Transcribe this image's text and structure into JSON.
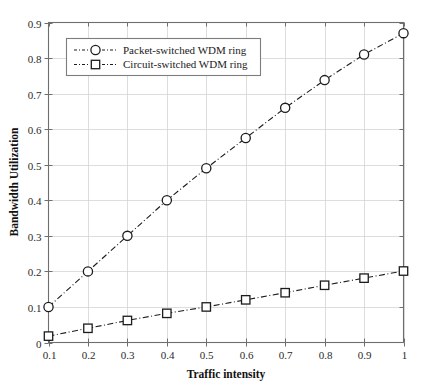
{
  "chart_data": {
    "type": "line",
    "title": "",
    "xlabel": "Traffic intensity",
    "ylabel": "Bandwidth Utilization",
    "x": [
      0.1,
      0.2,
      0.3,
      0.4,
      0.5,
      0.6,
      0.7,
      0.8,
      0.9,
      1.0
    ],
    "xtick_labels": [
      "0.1",
      "0.2",
      "0.3",
      "0.4",
      "0.5",
      "0.6",
      "0.7",
      "0.8",
      "0.9",
      "1"
    ],
    "ytick_labels": [
      "0",
      "0.1",
      "0.2",
      "0.3",
      "0.4",
      "0.5",
      "0.6",
      "0.7",
      "0.8",
      "0.9"
    ],
    "yticks": [
      0,
      0.1,
      0.2,
      0.3,
      0.4,
      0.5,
      0.6,
      0.7,
      0.8,
      0.9
    ],
    "xlim": [
      0.1,
      1.0
    ],
    "ylim": [
      0.0,
      0.9
    ],
    "grid": true,
    "legend_position": "upper left",
    "series": [
      {
        "name": "Packet-switched WDM ring",
        "marker": "circle",
        "linestyle": "dashdot",
        "color": "#1c1c1c",
        "values": [
          0.1,
          0.2,
          0.3,
          0.4,
          0.49,
          0.575,
          0.66,
          0.738,
          0.81,
          0.87
        ]
      },
      {
        "name": "Circuit-switched WDM ring",
        "marker": "square",
        "linestyle": "dashdot",
        "color": "#1c1c1c",
        "values": [
          0.018,
          0.04,
          0.062,
          0.082,
          0.1,
          0.12,
          0.14,
          0.161,
          0.181,
          0.201
        ]
      }
    ]
  },
  "legend": {
    "entries": [
      {
        "label": "Packet-switched WDM ring",
        "marker": "circle-marker-icon"
      },
      {
        "label": "Circuit-switched WDM ring",
        "marker": "square-marker-icon"
      }
    ]
  },
  "axes": {
    "x_title": "Traffic intensity",
    "y_title": "Bandwidth Utilization"
  }
}
